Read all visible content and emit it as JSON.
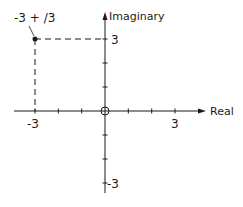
{
  "diagram": {
    "type": "complex-plane",
    "axes": {
      "x_label": "Real",
      "y_label": "Imaginary",
      "x_tick_labels": {
        "neg": "-3",
        "pos": "3"
      },
      "y_tick_labels": {
        "pos": "3",
        "neg": "-3"
      },
      "origin_marker": "circle"
    },
    "point": {
      "label": "-3 + j3",
      "label_display": "-3 + /3",
      "real": -3,
      "imaginary": 3
    },
    "colors": {
      "ink": "#1a1a1a",
      "background": "#ffffff"
    }
  }
}
